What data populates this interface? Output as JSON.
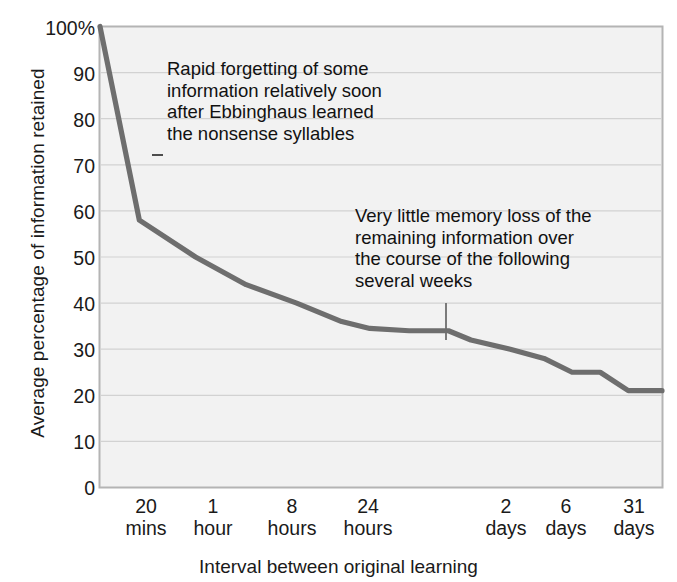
{
  "chart_data": {
    "type": "line",
    "title": "",
    "subtitle": "",
    "xlabel": "Interval between original learning",
    "ylabel": "Average percentage of information retained",
    "ylim": [
      0,
      100
    ],
    "grid": true,
    "legend": "none",
    "y_ticks": [
      "100%",
      "90",
      "80",
      "70",
      "60",
      "50",
      "40",
      "30",
      "20",
      "10",
      "0"
    ],
    "y_tick_values": [
      100,
      90,
      80,
      70,
      60,
      50,
      40,
      30,
      20,
      10,
      0
    ],
    "x_ticks": [
      {
        "value": "20",
        "unit": "mins"
      },
      {
        "value": "1",
        "unit": "hour"
      },
      {
        "value": "8",
        "unit": "hours"
      },
      {
        "value": "24",
        "unit": "hours"
      },
      {
        "value": "2",
        "unit": "days"
      },
      {
        "value": "6",
        "unit": "days"
      },
      {
        "value": "31",
        "unit": "days"
      }
    ],
    "categories": [
      "0",
      "20 mins",
      "1 hour",
      "8 hours",
      "24 hours",
      "2 days",
      "6 days",
      "31 days"
    ],
    "values": [
      100,
      58,
      44,
      36,
      34,
      28,
      25,
      21
    ],
    "series": [
      {
        "name": "Retention",
        "color": "#6e6e6e",
        "points": [
          {
            "x": 0,
            "y": 100
          },
          {
            "x": 7,
            "y": 58
          },
          {
            "x": 17,
            "y": 50
          },
          {
            "x": 26,
            "y": 44
          },
          {
            "x": 35,
            "y": 40
          },
          {
            "x": 43,
            "y": 36
          },
          {
            "x": 48,
            "y": 34.5
          },
          {
            "x": 55,
            "y": 34
          },
          {
            "x": 62,
            "y": 34
          },
          {
            "x": 66,
            "y": 32
          },
          {
            "x": 73,
            "y": 30
          },
          {
            "x": 79,
            "y": 28
          },
          {
            "x": 84,
            "y": 25
          },
          {
            "x": 89,
            "y": 25
          },
          {
            "x": 94,
            "y": 21
          },
          {
            "x": 100,
            "y": 21
          }
        ]
      }
    ],
    "annotations": [
      {
        "id": "annotation-1",
        "text": "Rapid forgetting of some\ninformation relatively soon\nafter Ebbinghaus learned\nthe nonsense syllables",
        "leader": "dash"
      },
      {
        "id": "annotation-2",
        "text": "Very little memory loss of the\nremaining information over\nthe course of the following\nseveral weeks",
        "leader": "vertical-line"
      }
    ],
    "colors": {
      "line": "#6e6e6e",
      "plot_background": "#f2f2f2",
      "grid": "#d2d2d2",
      "border": "#b4b4b4",
      "text": "#1a1a1a"
    }
  }
}
